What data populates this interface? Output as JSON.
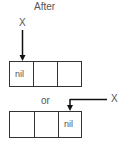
{
  "title": "After",
  "pointer_label_top": "X",
  "separator": "or",
  "pointer_label_bottom": "X",
  "top_list": {
    "cells": [
      "nil",
      "",
      ""
    ],
    "pointer_cell": 0
  },
  "bottom_list": {
    "cells": [
      "",
      "",
      "nil"
    ],
    "pointer_cell": 2
  }
}
